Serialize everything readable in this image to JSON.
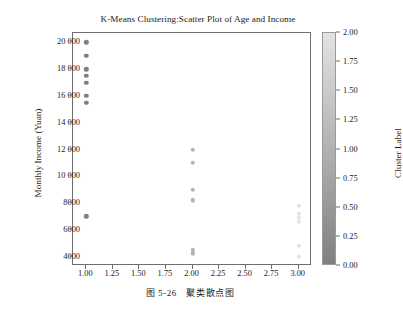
{
  "chart_data": {
    "type": "scatter",
    "title": "K-Means Clustering:Scatter Plot of Age and Income",
    "xlabel": "",
    "ylabel": "Monthly Income (Yuan)",
    "xlim": [
      0.875,
      3.125
    ],
    "ylim": [
      3300,
      20700
    ],
    "grid": false,
    "xticks": [
      1.0,
      1.25,
      1.5,
      1.75,
      2.0,
      2.25,
      2.5,
      2.75,
      3.0
    ],
    "xticklabels": [
      "1.00",
      "1.25",
      "1.50",
      "1.75",
      "2.00",
      "2.25",
      "2.50",
      "2.75",
      "3.00"
    ],
    "yticks": [
      4000,
      6000,
      8000,
      10000,
      12000,
      14000,
      16000,
      18000,
      20000
    ],
    "yticklabels": [
      "4000",
      "6000",
      "8000",
      "10 000",
      "12 000",
      "14 000",
      "16 000",
      "18 000",
      "20 000"
    ],
    "colorbar": {
      "label": "Cluster Label",
      "ticks": [
        0.0,
        0.25,
        0.5,
        0.75,
        1.0,
        1.25,
        1.5,
        1.75,
        2.0
      ],
      "ticklabels": [
        "0.00",
        "0.25",
        "0.50",
        "0.75",
        "1.00",
        "1.25",
        "1.50",
        "1.75",
        "2.00"
      ],
      "vmin": 0.0,
      "vmax": 2.0,
      "colormap": "gray-light-to-dark",
      "color_low": "#808080",
      "color_high": "#e3e3e3",
      "position": "right"
    },
    "points": [
      {
        "x": 1.0,
        "y": 20000,
        "c": 0
      },
      {
        "x": 1.0,
        "y": 19000,
        "c": 0
      },
      {
        "x": 1.0,
        "y": 18000,
        "c": 0
      },
      {
        "x": 1.0,
        "y": 17500,
        "c": 0
      },
      {
        "x": 1.0,
        "y": 17000,
        "c": 0
      },
      {
        "x": 1.0,
        "y": 16000,
        "c": 0
      },
      {
        "x": 1.0,
        "y": 15500,
        "c": 0
      },
      {
        "x": 1.0,
        "y": 7000,
        "c": 0
      },
      {
        "x": 2.0,
        "y": 12000,
        "c": 1
      },
      {
        "x": 2.0,
        "y": 11000,
        "c": 1
      },
      {
        "x": 2.0,
        "y": 9000,
        "c": 1
      },
      {
        "x": 2.0,
        "y": 8200,
        "c": 1
      },
      {
        "x": 2.0,
        "y": 4500,
        "c": 1
      },
      {
        "x": 2.0,
        "y": 4300,
        "c": 1
      },
      {
        "x": 2.0,
        "y": 4200,
        "c": 1
      },
      {
        "x": 3.0,
        "y": 7800,
        "c": 2
      },
      {
        "x": 3.0,
        "y": 7200,
        "c": 2
      },
      {
        "x": 3.0,
        "y": 6900,
        "c": 2
      },
      {
        "x": 3.0,
        "y": 6600,
        "c": 2
      },
      {
        "x": 3.0,
        "y": 4800,
        "c": 2
      },
      {
        "x": 3.0,
        "y": 4000,
        "c": 2
      }
    ]
  },
  "caption": "图 5-26　聚类散点图"
}
